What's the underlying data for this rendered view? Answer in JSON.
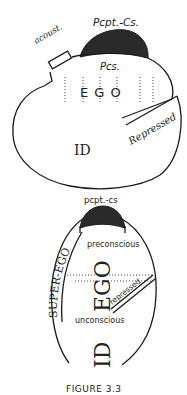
{
  "figure_top": {
    "labels": {
      "pcpt_cs": "Pcpt.-Cs.",
      "acoust": "acoust.",
      "pcs": "Pcs.",
      "ego": "E G O",
      "repressed": "Repressed",
      "id": "ID"
    }
  },
  "figure_bottom": {
    "labels": {
      "pcpt_cs": "pcpt.-cs",
      "preconscious": "preconscious",
      "super_ego": "SUPER-EGO",
      "ego": "EGO",
      "repressed": "repressed",
      "unconscious": "unconscious",
      "id": "ID"
    }
  },
  "caption": "FIGURE 3.3",
  "colors": {
    "ink": "#1a1a1a",
    "cap_fill": "#2a2a2a",
    "background": "#ffffff"
  }
}
